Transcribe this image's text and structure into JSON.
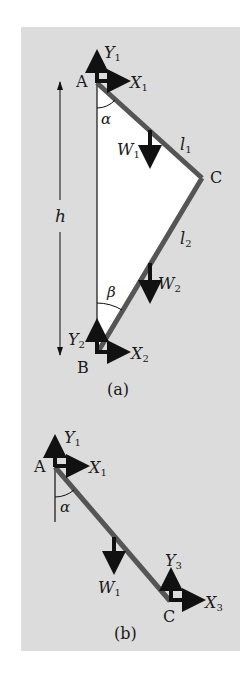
{
  "colors": {
    "panel": "#dcdcdc",
    "triangle_fill": "#ffffff",
    "bar": "#555555",
    "arrow": "#111111",
    "text": "#1a1a1a"
  },
  "figure_a": {
    "caption": "(a)",
    "points": {
      "A": "A",
      "B": "B",
      "C": "C"
    },
    "forces": {
      "Y1": {
        "sym": "Y",
        "sub": "1"
      },
      "X1": {
        "sym": "X",
        "sub": "1"
      },
      "W1": {
        "sym": "W",
        "sub": "1"
      },
      "W2": {
        "sym": "W",
        "sub": "2"
      },
      "Y2": {
        "sym": "Y",
        "sub": "2"
      },
      "X2": {
        "sym": "X",
        "sub": "2"
      }
    },
    "lengths": {
      "l1": {
        "sym": "l",
        "sub": "1"
      },
      "l2": {
        "sym": "l",
        "sub": "2"
      },
      "h": "h"
    },
    "angles": {
      "alpha": "α",
      "beta": "β"
    }
  },
  "figure_b": {
    "caption": "(b)",
    "points": {
      "A": "A",
      "C": "C"
    },
    "forces": {
      "Y1": {
        "sym": "Y",
        "sub": "1"
      },
      "X1": {
        "sym": "X",
        "sub": "1"
      },
      "W1": {
        "sym": "W",
        "sub": "1"
      },
      "Y3": {
        "sym": "Y",
        "sub": "3"
      },
      "X3": {
        "sym": "X",
        "sub": "3"
      }
    },
    "angles": {
      "alpha": "α"
    }
  }
}
